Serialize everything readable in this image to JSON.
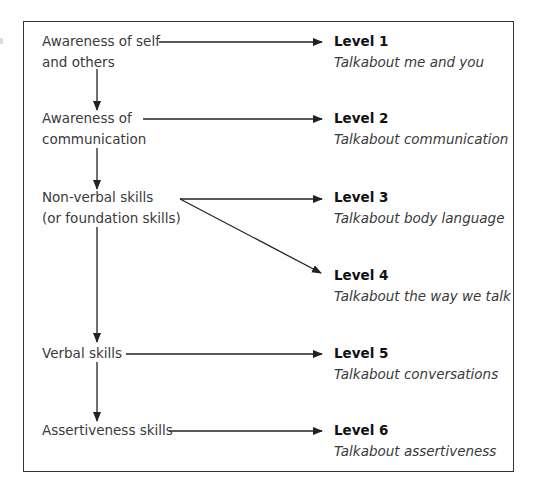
{
  "diagram": {
    "stages": [
      {
        "lines": [
          "Awareness of self",
          "and others"
        ]
      },
      {
        "lines": [
          "Awareness of",
          "communication"
        ]
      },
      {
        "lines": [
          "Non-verbal skills",
          "(or foundation skills)"
        ]
      },
      {
        "lines": [
          "Verbal skills"
        ]
      },
      {
        "lines": [
          "Assertiveness skills"
        ]
      }
    ],
    "levels": [
      {
        "title": "Level 1",
        "subtitle": "Talkabout me and you"
      },
      {
        "title": "Level 2",
        "subtitle": "Talkabout communication"
      },
      {
        "title": "Level 3",
        "subtitle": "Talkabout body language"
      },
      {
        "title": "Level 4",
        "subtitle": "Talkabout the way we talk"
      },
      {
        "title": "Level 5",
        "subtitle": "Talkabout conversations"
      },
      {
        "title": "Level 6",
        "subtitle": "Talkabout assertiveness"
      }
    ],
    "colors": {
      "line": "#222222",
      "text": "#3a3a3a",
      "title": "#111111",
      "border": "#333333"
    }
  }
}
